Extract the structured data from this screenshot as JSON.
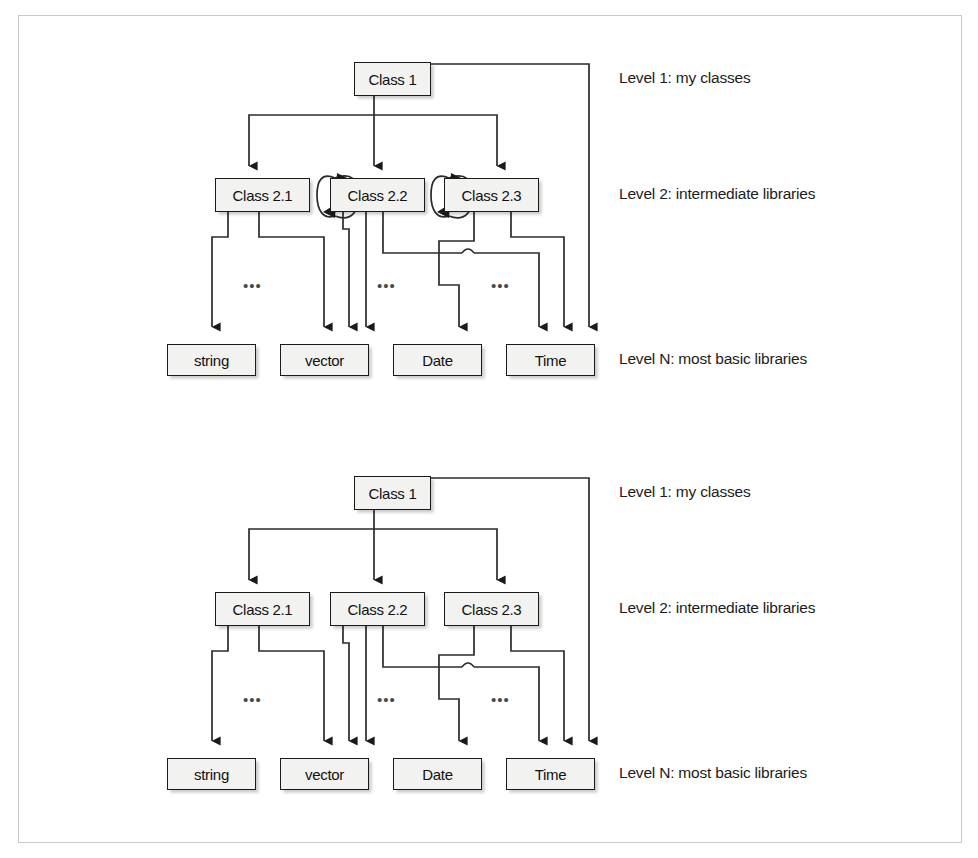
{
  "figure": {
    "border_color": "#c9c9c9",
    "node_fill": "#f2f2f0",
    "node_stroke": "#1a1a1a",
    "line_color": "#2b2b2b",
    "ellipsis": "•••"
  },
  "levels": {
    "level1": "Level 1: my classes",
    "level2": "Level 2: intermediate libraries",
    "leveln": "Level N: most basic libraries"
  },
  "nodes": {
    "root": "Class 1",
    "mid": [
      "Class 2.1",
      "Class 2.2",
      "Class 2.3"
    ],
    "base": [
      "string",
      "vector",
      "Date",
      "Time"
    ]
  },
  "panels": [
    {
      "id": "top",
      "caption": "cyclic dependencies between intermediate libraries",
      "has_cycles": true,
      "cycles": [
        {
          "between": [
            "Class 2.1",
            "Class 2.2"
          ],
          "bidirectional": true
        },
        {
          "between": [
            "Class 2.2",
            "Class 2.3"
          ],
          "bidirectional": true
        }
      ]
    },
    {
      "id": "bottom",
      "caption": "acyclic dependencies between intermediate libraries",
      "has_cycles": false,
      "cycles": []
    }
  ],
  "edges": {
    "root_to_mid": [
      {
        "from": "Class 1",
        "to": "Class 2.1"
      },
      {
        "from": "Class 1",
        "to": "Class 2.2"
      },
      {
        "from": "Class 1",
        "to": "Class 2.3"
      }
    ],
    "root_to_base": [
      {
        "from": "Class 1",
        "to": "Time"
      }
    ],
    "mid_to_base": [
      {
        "from": "Class 2.1",
        "to": "string"
      },
      {
        "from": "Class 2.1",
        "to": "vector"
      },
      {
        "from": "Class 2.2",
        "to": "vector"
      },
      {
        "from": "Class 2.2",
        "to": "Date"
      },
      {
        "from": "Class 2.2",
        "to": "Time"
      },
      {
        "from": "Class 2.3",
        "to": "Date"
      },
      {
        "from": "Class 2.3",
        "to": "Time"
      }
    ]
  },
  "arrow_counts_into_base": {
    "string": 1,
    "vector": 2,
    "Date": 2,
    "Time": 3
  }
}
